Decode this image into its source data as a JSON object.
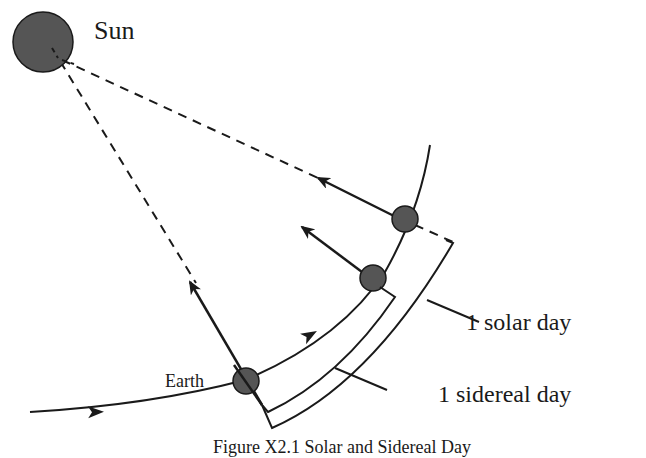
{
  "diagram": {
    "title": "Solar and Sidereal Day",
    "labels": {
      "sun": "Sun",
      "earth": "Earth",
      "solar_day": "1 solar day",
      "sidereal_day": "1 sidereal day"
    },
    "caption": "Figure X2.1 Solar and Sidereal Day",
    "colors": {
      "body_fill": "#555555",
      "line": "#1a1a1a",
      "background": "#ffffff"
    },
    "elements": {
      "bodies": [
        "Sun",
        "Earth (position 1)",
        "Earth (position 2)",
        "Earth (position 3)"
      ],
      "orbit_direction": "counter-clockwise (arrows along orbit)",
      "brackets": [
        "1 sidereal day (inner)",
        "1 solar day (outer)"
      ]
    }
  }
}
